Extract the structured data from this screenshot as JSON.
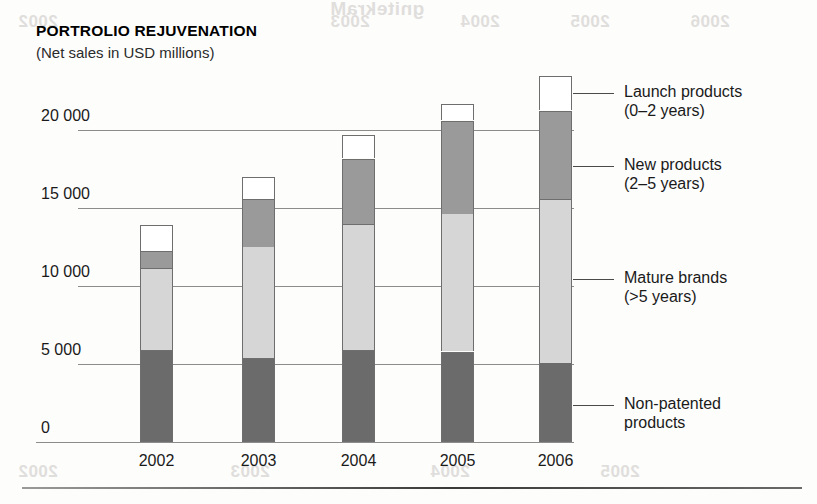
{
  "chart_data": {
    "type": "bar",
    "subtype": "stacked-column",
    "title": "PORTROLIO REJUVENATION",
    "subtitle": "(Net sales in USD millions)",
    "xlabel": "",
    "ylabel": "",
    "categories": [
      "2002",
      "2003",
      "2004",
      "2005",
      "2006"
    ],
    "ytick_labels": [
      "20 000",
      "15 000",
      "10 000",
      "5 000",
      "0"
    ],
    "ytick_values": [
      20000,
      15000,
      10000,
      5000,
      0
    ],
    "ylim": [
      0,
      22500
    ],
    "grid": true,
    "legend_position": "right",
    "series": [
      {
        "name": "Non-patented products",
        "color": "#6b6b6b",
        "values": [
          5900,
          5400,
          5900,
          5800,
          5100
        ]
      },
      {
        "name": "Mature brands",
        "color": "#d6d6d6",
        "values": [
          5250,
          7150,
          8100,
          8850,
          10500
        ]
      },
      {
        "name": "New products",
        "color": "#9a9a9a",
        "values": [
          1100,
          3050,
          4150,
          5950,
          5650
        ]
      },
      {
        "name": "Launch products",
        "color": "#ffffff",
        "values": [
          1650,
          1400,
          1500,
          1050,
          2200
        ]
      }
    ],
    "totals": [
      13900,
      17000,
      19600,
      21650,
      23450
    ]
  },
  "legend": [
    {
      "line1": "Launch products",
      "line2": "(0–2 years)"
    },
    {
      "line1": "New products",
      "line2": "(2–5 years)"
    },
    {
      "line1": "Mature brands",
      "line2": "(>5 years)"
    },
    {
      "line1": "Non-patented",
      "line2": "products"
    }
  ],
  "artifacts": {
    "bleed_top": "gnitekraM",
    "bleed_rows": [
      "2002",
      "2003",
      "2004",
      "2005",
      "2006"
    ]
  }
}
